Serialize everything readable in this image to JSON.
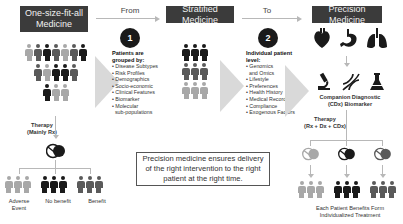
{
  "stages": {
    "left": {
      "title": "One-size-fit-all Medicine"
    },
    "middle": {
      "title": "Stratified Medicine"
    },
    "right": {
      "title": "Precision Medicine"
    }
  },
  "connectors": {
    "from_label": "From",
    "to_label": "To"
  },
  "step1": {
    "number": "1",
    "heading": "Patients are grouped by:",
    "items": [
      "Disease Subtypes",
      "Risk Profiles",
      "Demographics",
      "Socio-economic",
      "Clinical Features",
      "Biomarker",
      "Molecular",
      "sub-populations"
    ]
  },
  "step2": {
    "number": "2",
    "heading": "Individual patient level:",
    "items": [
      "Genomics",
      "and Omics",
      "Lifestyle",
      "Preferences",
      "Health History",
      "Medical Records",
      "Compliance",
      "Exogenous Factors"
    ]
  },
  "left_panel": {
    "therapy_label": "Therapy",
    "therapy_sub": "(Mainly Rx)",
    "outcomes": [
      "Adverse Event",
      "No benefit",
      "Benefit"
    ]
  },
  "right_panel": {
    "organs": [
      "heart-icon",
      "stomach-icon",
      "lungs-icon"
    ],
    "tools": [
      "microscope-icon",
      "dna-icon",
      "flask-icon"
    ],
    "diagnostic_label": "Companion Diagnostic",
    "diagnostic_sub": "(CDx) Biomarker",
    "therapy_label": "Therapy",
    "therapy_sub": "(Rx + Dx + CDx)",
    "result_line1": "Each Patient Benefits Form",
    "result_line2": "Individualized Treatment"
  },
  "quote": {
    "line1": "Precision medicine ensures delivery",
    "line2": "of the right intervention to the right",
    "line3": "patient at the right time."
  },
  "colors": {
    "title_bg": "#3b3b3b",
    "dark": "#1a1a1a",
    "mid": "#5a5a5a",
    "light": "#a8a8a8",
    "arrow": "#d9d9d9",
    "line": "#b8b8b8"
  }
}
